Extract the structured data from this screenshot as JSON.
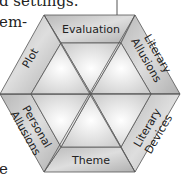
{
  "background_text": {
    "line1": "d settings.",
    "line2": "em-",
    "line3": "e"
  },
  "diagram": {
    "type": "hexagon-segments",
    "segments": [
      {
        "id": "evaluation",
        "label": [
          "Evaluation"
        ]
      },
      {
        "id": "literary-allusions",
        "label": [
          "Literary",
          "Allusions"
        ]
      },
      {
        "id": "literary-devices",
        "label": [
          "Literary",
          "Devices"
        ]
      },
      {
        "id": "theme",
        "label": [
          "Theme"
        ]
      },
      {
        "id": "personal-allusions",
        "label": [
          "Personal",
          "Allusions"
        ]
      },
      {
        "id": "plot",
        "label": [
          "Plot"
        ]
      }
    ],
    "colors": {
      "outer_fill": "#c4c4c4",
      "inner_fill": "#e6e6e6",
      "stroke": "#555555"
    }
  }
}
